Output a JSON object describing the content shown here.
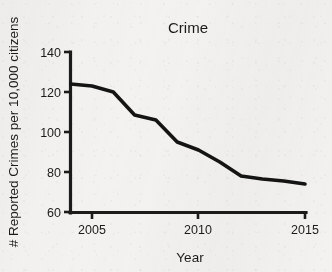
{
  "chart_data": {
    "type": "line",
    "title": "Crime",
    "xlabel": "Year",
    "ylabel": "# Reported Crimes per 10,000 citizens",
    "x": [
      2004,
      2005,
      2006,
      2007,
      2008,
      2009,
      2010,
      2011,
      2012,
      2013,
      2014,
      2015
    ],
    "values": [
      124,
      123,
      120,
      108.5,
      106,
      95,
      91,
      85,
      78,
      76.5,
      75.5,
      74
    ],
    "series": [
      {
        "name": "Reported crimes per 10,000 citizens",
        "values": [
          124,
          123,
          120,
          108.5,
          106,
          95,
          91,
          85,
          78,
          76.5,
          75.5,
          74
        ]
      }
    ],
    "xlim": [
      2004,
      2015
    ],
    "ylim": [
      60,
      140
    ],
    "xticks": [
      2005,
      2010,
      2015
    ],
    "yticks": [
      60,
      80,
      100,
      120,
      140
    ],
    "xtick_labels": [
      "2005",
      "2010",
      "2015"
    ],
    "ytick_labels": [
      "60",
      "80",
      "100",
      "120",
      "140"
    ],
    "grid": false,
    "legend": false,
    "legend_position": "none",
    "line_color": "#141414",
    "axis_color": "#1b1b1b",
    "background_color": "#f3f2f0"
  },
  "ticks": {
    "y": {
      "t0": "60",
      "t1": "80",
      "t2": "100",
      "t3": "120",
      "t4": "140"
    },
    "x": {
      "t0": "2005",
      "t1": "2010",
      "t2": "2015"
    }
  },
  "labels": {
    "title": "Crime",
    "x_axis": "Year",
    "y_axis": "# Reported Crimes per 10,000 citizens"
  }
}
